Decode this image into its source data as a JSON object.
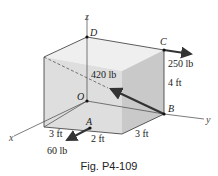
{
  "figure": {
    "caption": "Fig. P4-109",
    "axes": {
      "x": "x",
      "y": "y",
      "z": "z"
    },
    "points": {
      "O": "O",
      "A": "A",
      "B": "B",
      "C": "C",
      "D": "D"
    },
    "forces": [
      {
        "name": "force-B",
        "label": "420 lb",
        "at": "B"
      },
      {
        "name": "force-C",
        "label": "250 lb",
        "at": "C"
      },
      {
        "name": "force-A",
        "label": "60 lb",
        "at": "A"
      }
    ],
    "dimensions": [
      {
        "label": "3 ft",
        "where": "front-x"
      },
      {
        "label": "2 ft",
        "where": "front-a"
      },
      {
        "label": "3 ft",
        "where": "bottom-y"
      },
      {
        "label": "4 ft",
        "where": "height"
      }
    ],
    "colors": {
      "box_front": "#dcdcdc",
      "box_side": "#c8c8c8",
      "box_top": "#ececec",
      "line": "#222222",
      "arrow": "#333333"
    }
  }
}
